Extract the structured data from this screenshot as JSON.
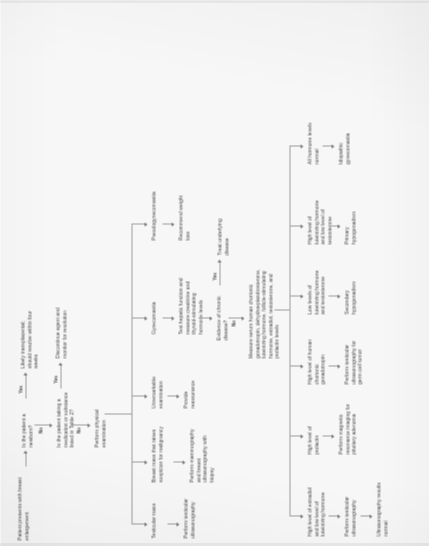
{
  "document": {
    "type": "clinical-algorithm-flowchart",
    "orientation": "rotated-90-ccw",
    "title": "Evaluation of breast enlargement in men"
  },
  "nodes": {
    "start": "Patient presents with breast enlargement",
    "q_newborn": "Is the patient a newborn?",
    "newborn_yes_outcome": "Likely transplacental; should resolve within four weeks",
    "q_medication": "Is the patient taking a medication or substance listed in Table 2?",
    "medication_yes_outcome": "Discontinue agent and monitor for resolution",
    "physical_exam": "Perform physical examination",
    "testicular_mass": "Testicular mass",
    "testicular_mass_action": "Perform testicular ultrasonography",
    "breast_mass": "Breast mass that raises suspicion for malignancy",
    "breast_mass_action": "Perform mammography and breast ultrasonography with biopsy",
    "unremarkable_exam": "Unremarkable examination",
    "unremarkable_action": "Provide reassurance",
    "gynecomastia": "Gynecomastia",
    "gynecomastia_action": "Test hepatic function and measure creatinine and thyroid-stimulating hormone levels",
    "pseudogynecomastia": "Pseudogynecomastia",
    "pseudogynecomastia_action": "Recommend weight loss",
    "q_chronic_disease": "Evidence of chronic disease?",
    "chronic_yes_outcome": "Treat underlying disease",
    "measure_labs": "Measure serum human chorionic gonadotropin, dehydroepiandrosterone, luteinizing hormone, follicle-stimulating hormone, estradiol, testosterone, and prolactin levels",
    "high_estradiol": "High level of estradiol and low level of luteinizing hormone",
    "high_estradiol_action": "Perform testicular ultrasonography",
    "high_estradiol_result": "Ultrasonography results normal",
    "high_prolactin": "High level of prolactin",
    "high_prolactin_action": "Perform magnetic resonance imaging for pituitary adenoma",
    "high_hcg": "High level of human chorionic gonadotropin",
    "high_hcg_action": "Perform testicular ultrasonography for germ cell tumor",
    "low_lh_testosterone": "Low levels of luteinizing hormone and testosterone",
    "low_lh_testosterone_result": "Secondary hypogonadism",
    "high_lh_low_testosterone": "High level of luteinizing hormone and low level of testosterone",
    "high_lh_low_testosterone_result": "Primary hypogonadism",
    "all_normal": "All hormone levels normal",
    "all_normal_result": "Idiopathic gynecomastia"
  },
  "edge_labels": {
    "newborn_yes": "Yes",
    "newborn_no": "No",
    "medication_yes": "Yes",
    "medication_no": "No",
    "chronic_yes": "Yes",
    "chronic_no": "No"
  }
}
